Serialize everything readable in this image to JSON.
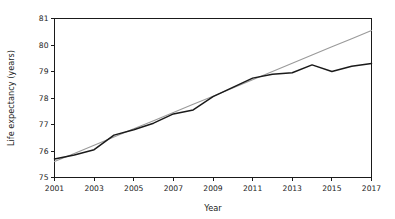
{
  "chart_data": {
    "type": "line",
    "title": "",
    "xlabel": "Year",
    "ylabel": "Life expectancy (years)",
    "xlim": [
      2001,
      2017
    ],
    "ylim": [
      75,
      81
    ],
    "grid": false,
    "legend": "none",
    "x": [
      2001,
      2002,
      2003,
      2004,
      2005,
      2006,
      2007,
      2008,
      2009,
      2010,
      2011,
      2012,
      2013,
      2014,
      2015,
      2016,
      2017
    ],
    "xticks": [
      2001,
      2003,
      2005,
      2007,
      2009,
      2011,
      2013,
      2015,
      2017
    ],
    "xtick_labels": [
      "2001",
      "2003",
      "2005",
      "2007",
      "2009",
      "2011",
      "2013",
      "2015",
      "2017"
    ],
    "yticks": [
      75,
      76,
      77,
      78,
      79,
      80,
      81
    ],
    "ytick_labels": [
      "75",
      "76",
      "77",
      "78",
      "79",
      "80",
      "81"
    ],
    "series": [
      {
        "name": "life-expectancy-observed",
        "style": "solid",
        "color": "#1a1a1a",
        "values": [
          75.7,
          75.85,
          76.05,
          76.6,
          76.8,
          77.05,
          77.4,
          77.55,
          78.05,
          78.4,
          78.75,
          78.9,
          78.95,
          79.25,
          79.0,
          79.2,
          79.3
        ]
      },
      {
        "name": "linear-trend",
        "style": "solid",
        "color": "#9a9a9a",
        "values": [
          75.6,
          75.91,
          76.22,
          76.53,
          76.84,
          77.14,
          77.45,
          77.76,
          78.07,
          78.38,
          78.69,
          79.0,
          79.31,
          79.62,
          79.93,
          80.24,
          80.55
        ]
      }
    ]
  }
}
